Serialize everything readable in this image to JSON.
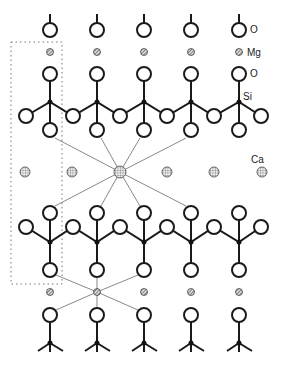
{
  "diagram": {
    "type": "crystal-structure",
    "labels": {
      "o_top": "O",
      "mg": "Mg",
      "o_mid": "O",
      "si": "Si",
      "ca": "Ca"
    },
    "colors": {
      "stroke": "#1a1a1a",
      "thin_line": "#555555",
      "dotted_box": "#777777",
      "ion_fill": "#cfcfcf"
    },
    "columns_x": [
      50,
      97,
      144,
      191,
      239
    ],
    "ca_row_x": [
      25,
      72,
      120,
      167,
      214,
      262
    ],
    "legend_atoms": [
      "O",
      "Mg",
      "Si",
      "Ca"
    ]
  }
}
